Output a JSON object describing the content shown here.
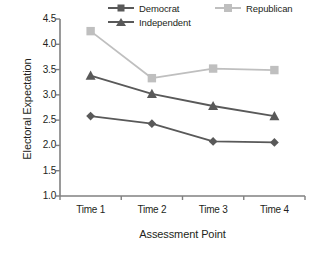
{
  "chart_data": {
    "type": "line",
    "title": "",
    "xlabel": "Assessment Point",
    "ylabel": "Electoral Expectation",
    "categories": [
      "Time 1",
      "Time 2",
      "Time 3",
      "Time 4"
    ],
    "ylim": [
      1.0,
      4.5
    ],
    "yticks": [
      "1.0",
      "1.5",
      "2.0",
      "2.5",
      "3.0",
      "3.5",
      "4.0",
      "4.5"
    ],
    "ytick_values": [
      1.0,
      1.5,
      2.0,
      2.5,
      3.0,
      3.5,
      4.0,
      4.5
    ],
    "grid": false,
    "legend_position": "top",
    "series": [
      {
        "name": "Democrat",
        "marker": "diamond",
        "color": "#595959",
        "values": [
          2.58,
          2.43,
          2.08,
          2.06
        ]
      },
      {
        "name": "Republican",
        "marker": "square",
        "color": "#bfbfbf",
        "values": [
          4.26,
          3.33,
          3.52,
          3.49
        ]
      },
      {
        "name": "Independent",
        "marker": "triangle",
        "color": "#595959",
        "values": [
          3.38,
          3.02,
          2.78,
          2.58
        ]
      }
    ]
  },
  "axis": {
    "color": "#808080"
  }
}
